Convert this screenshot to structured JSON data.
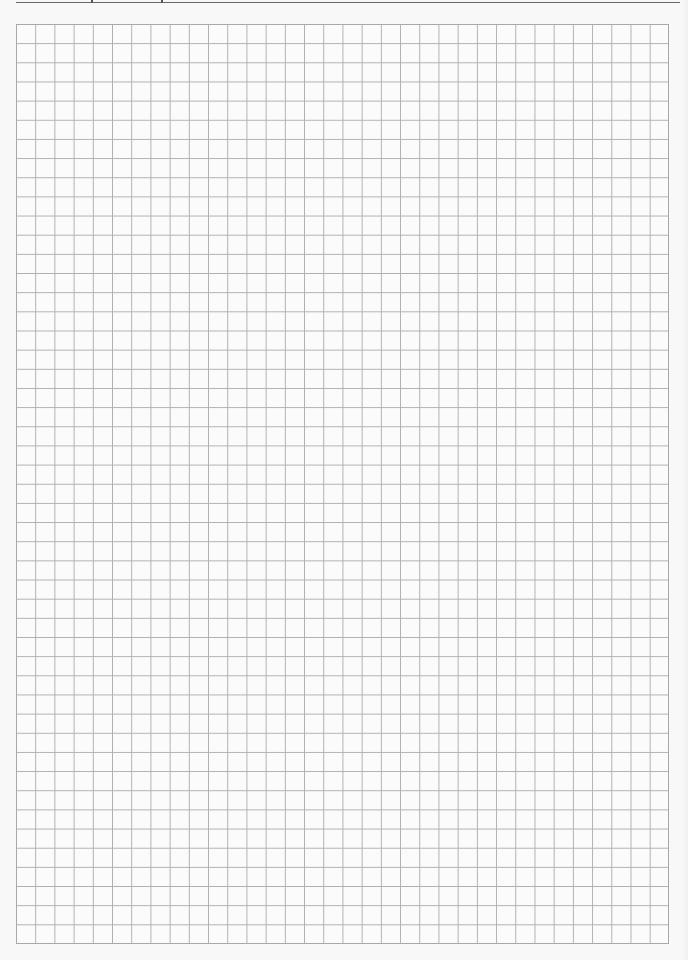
{
  "document": {
    "type": "graph-paper",
    "header_text": "",
    "grid": {
      "columns": 34,
      "rows": 48,
      "cell_size_px": 19.2,
      "line_color": "#b0b0b0",
      "border_color": "#a9a9a9",
      "background_color": "#fbfbfb"
    },
    "top_rule": {
      "color": "#6a6a6a",
      "tick_positions_px": [
        91,
        161
      ]
    }
  }
}
